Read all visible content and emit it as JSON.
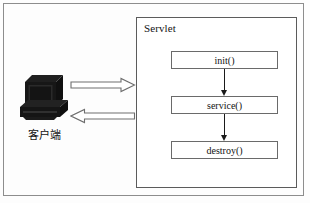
{
  "diagram": {
    "outer_frame": {
      "name": "diagram-border"
    },
    "container": {
      "label": "Servlet",
      "border_color": "#5b5b5b"
    },
    "client": {
      "label": "客户端",
      "icon": "desktop-computer-icon",
      "icon_color": "#121212"
    },
    "flow_arrows": [
      {
        "name": "request-arrow",
        "direction": "right",
        "label": ""
      },
      {
        "name": "response-arrow",
        "direction": "left",
        "label": ""
      }
    ],
    "lifecycle_methods": [
      {
        "label": "init()"
      },
      {
        "label": "service()"
      },
      {
        "label": "destroy()"
      }
    ],
    "connectors": [
      {
        "from": "init()",
        "to": "service()",
        "style": "arrow-down"
      },
      {
        "from": "service()",
        "to": "destroy()",
        "style": "arrow-down"
      }
    ],
    "colors": {
      "background": "#fdfdfd",
      "box_border": "#6a6a6a",
      "arrow_outline": "#6e6e6e",
      "text": "#121212"
    }
  }
}
